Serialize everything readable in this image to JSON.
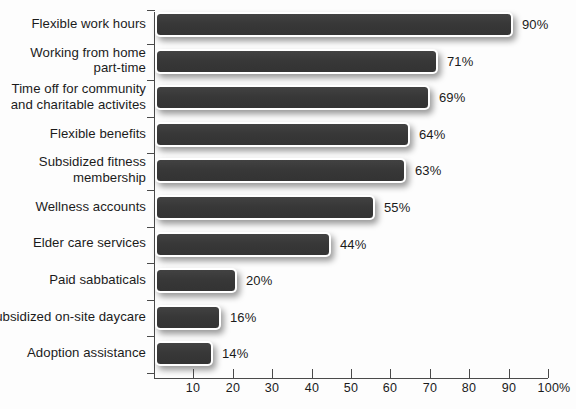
{
  "chart_data": {
    "type": "bar",
    "orientation": "horizontal",
    "title": "",
    "xlabel": "",
    "ylabel": "",
    "xlim": [
      0,
      100
    ],
    "xticks": [
      10,
      20,
      30,
      40,
      50,
      60,
      70,
      80,
      90,
      100
    ],
    "xtick_labels": [
      "10",
      "20",
      "30",
      "40",
      "50",
      "60",
      "70",
      "80",
      "90",
      "100%"
    ],
    "grid": false,
    "legend": false,
    "bar_color": "#3a3a3a",
    "background_color": "#fdfdfd",
    "axis_color": "#4a4a4a",
    "categories": [
      "Flexible work hours",
      "Working from home part-time",
      "Time off for community and charitable activites",
      "Flexible benefits",
      "Subsidized fitness membership",
      "Wellness accounts",
      "Elder care services",
      "Paid sabbaticals",
      "Subsidized on-site daycare",
      "Adoption assistance"
    ],
    "values": [
      90,
      71,
      69,
      64,
      63,
      55,
      44,
      20,
      16,
      14
    ],
    "value_labels": [
      "90%",
      "71%",
      "69%",
      "64%",
      "63%",
      "55%",
      "44%",
      "20%",
      "16%",
      "14%"
    ],
    "rows": [
      {
        "line1": "Flexible work hours",
        "line2": "",
        "value": 90,
        "value_label": "90%"
      },
      {
        "line1": "Working from home",
        "line2": "part-time",
        "value": 71,
        "value_label": "71%"
      },
      {
        "line1": "Time off for community",
        "line2": "and charitable activites",
        "value": 69,
        "value_label": "69%"
      },
      {
        "line1": "Flexible benefits",
        "line2": "",
        "value": 64,
        "value_label": "64%"
      },
      {
        "line1": "Subsidized fitness",
        "line2": "membership",
        "value": 63,
        "value_label": "63%"
      },
      {
        "line1": "Wellness accounts",
        "line2": "",
        "value": 55,
        "value_label": "55%"
      },
      {
        "line1": "Elder care services",
        "line2": "",
        "value": 44,
        "value_label": "44%"
      },
      {
        "line1": "Paid sabbaticals",
        "line2": "",
        "value": 20,
        "value_label": "20%"
      },
      {
        "line1": "Subsidized on-site daycare",
        "line2": "",
        "value": 16,
        "value_label": "16%"
      },
      {
        "line1": "Adoption assistance",
        "line2": "",
        "value": 14,
        "value_label": "14%"
      }
    ]
  }
}
